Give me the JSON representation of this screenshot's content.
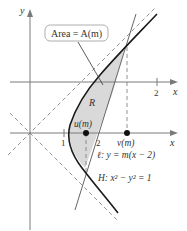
{
  "diagram": {
    "axes": {
      "x_label": "x",
      "y_label": "y",
      "upper_x_label": "x",
      "upper_tick": "2",
      "tick_1": "1",
      "tick_2": "2"
    },
    "area_label": "Area = A(m)",
    "region_label": "R",
    "points": {
      "u": "u(m)",
      "v": "v(m)"
    },
    "line_label": "ℓ: y = m(x − 2)",
    "hyperbola_label": "H: x² − y² = 1",
    "colors": {
      "curve": "#1a1a1a",
      "axis": "#7a7a7a",
      "region_fill": "#d9d9d9",
      "line": "#666666",
      "dashed": "#777777"
    }
  }
}
